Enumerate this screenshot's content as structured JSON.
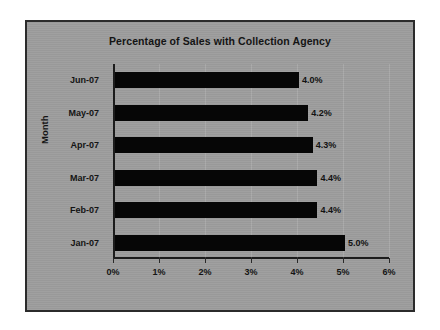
{
  "chart_data": {
    "type": "bar",
    "orientation": "horizontal",
    "title": "Percentage of Sales with Collection Agency",
    "xlabel": "",
    "ylabel": "Month",
    "categories": [
      "Jun-07",
      "May-07",
      "Apr-07",
      "Mar-07",
      "Feb-07",
      "Jan-07"
    ],
    "values": [
      4.0,
      4.2,
      4.3,
      4.4,
      4.4,
      5.0
    ],
    "data_labels": [
      "4.0%",
      "4.2%",
      "4.3%",
      "4.4%",
      "4.4%",
      "5.0%"
    ],
    "xlim": [
      0,
      6
    ],
    "xticks": [
      0,
      1,
      2,
      3,
      4,
      5,
      6
    ],
    "xtick_labels": [
      "0%",
      "1%",
      "2%",
      "3%",
      "4%",
      "5%",
      "6%"
    ],
    "grid": false,
    "legend": null,
    "bar_color": "#060606",
    "plot_background": "#9d9d9d",
    "frame_border_color": "#2b2b2b",
    "text_color": "#141414"
  }
}
